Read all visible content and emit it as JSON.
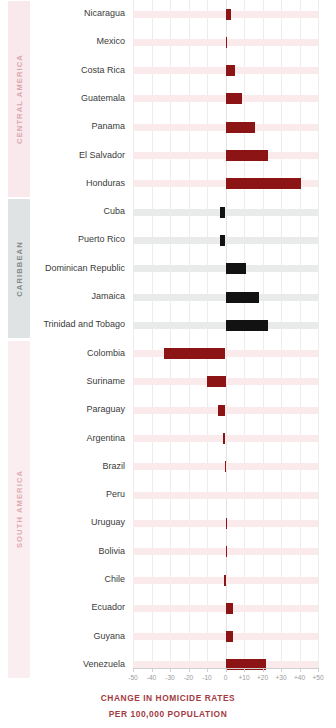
{
  "chart_data": {
    "type": "bar",
    "orientation": "horizontal",
    "title": "CHANGE IN HOMICIDE RATES",
    "subtitle": "PER 100,000 POPULATION",
    "xlabel": "",
    "ylabel": "",
    "xlim": [
      -50,
      50
    ],
    "grid": true,
    "legend": null,
    "tick_labels": [
      "-50",
      "-40",
      "-30",
      "-20",
      "-10",
      "0",
      "+10",
      "+20",
      "+30",
      "+40",
      "+50"
    ],
    "tick_values": [
      -50,
      -40,
      -30,
      -20,
      -10,
      0,
      10,
      20,
      30,
      40,
      50
    ],
    "groups": [
      {
        "name": "CENTRAL AMERICA",
        "color": "#8c1414",
        "band_color": "#fae9ec",
        "stripe_color": "#fbeaec",
        "categories": [
          "Nicaragua",
          "Mexico",
          "Costa Rica",
          "Guatemala",
          "Panama",
          "El Salvador",
          "Honduras"
        ],
        "values": [
          3,
          1,
          5,
          9,
          16,
          23,
          41
        ]
      },
      {
        "name": "CARIBBEAN",
        "color": "#121212",
        "band_color": "#dfe3e3",
        "stripe_color": "#e9eaea",
        "categories": [
          "Cuba",
          "Puerto Rico",
          "Dominican Republic",
          "Jamaica",
          "Trinidad and Tobago"
        ],
        "values": [
          -3,
          -3,
          11,
          18,
          23
        ]
      },
      {
        "name": "SOUTH AMERICA",
        "color": "#8c1414",
        "band_color": "#fbeef0",
        "stripe_color": "#fbeaec",
        "categories": [
          "Colombia",
          "Suriname",
          "Paraguay",
          "Argentina",
          "Brazil",
          "Peru",
          "Uruguay",
          "Bolivia",
          "Chile",
          "Ecuador",
          "Guyana",
          "Venezuela"
        ],
        "values": [
          -33,
          -10,
          -4,
          -1.5,
          -0.5,
          0,
          0.4,
          0.4,
          -0.6,
          4,
          4,
          22
        ]
      }
    ]
  },
  "colors": {
    "red": "#8c1414",
    "black": "#121212",
    "caption": "#a33b42",
    "stripe_red": "#fbeaec",
    "stripe_gray": "#e9eaea",
    "gridline": "#ececec"
  }
}
